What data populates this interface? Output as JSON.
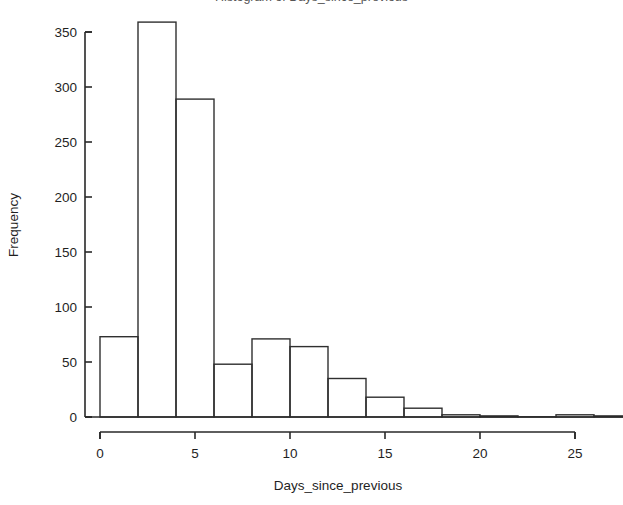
{
  "chart_data": {
    "type": "bar",
    "subtype": "histogram",
    "title": "Histogram of Days_since_previous",
    "title_cropped": true,
    "xlabel": "Days_since_previous",
    "ylabel": "Frequency",
    "bin_width": 2,
    "bin_edges": [
      0,
      2,
      4,
      6,
      8,
      10,
      12,
      14,
      16,
      18,
      20,
      22,
      24,
      26,
      28
    ],
    "categories": [
      "0-2",
      "2-4",
      "4-6",
      "6-8",
      "8-10",
      "10-12",
      "12-14",
      "14-16",
      "16-18",
      "18-20",
      "20-22",
      "22-24",
      "24-26",
      "26-28"
    ],
    "values": [
      73,
      359,
      289,
      48,
      71,
      64,
      35,
      18,
      8,
      2,
      1,
      0,
      2,
      1
    ],
    "xlim": [
      0,
      28
    ],
    "ylim": [
      0,
      350
    ],
    "xticks": [
      0,
      5,
      10,
      15,
      20,
      25
    ],
    "xtick_labels": [
      "0",
      "5",
      "10",
      "15",
      "20",
      "25"
    ],
    "yticks": [
      0,
      50,
      100,
      150,
      200,
      250,
      300,
      350
    ],
    "ytick_labels": [
      "0",
      "50",
      "100",
      "150",
      "200",
      "250",
      "300",
      "350"
    ],
    "grid": false,
    "legend": false,
    "bar_fill": "#ffffff",
    "bar_stroke": "#2f2f2f",
    "background": "#ffffff"
  },
  "axes": {
    "y_title": "Frequency",
    "x_title": "Days_since_previous"
  }
}
